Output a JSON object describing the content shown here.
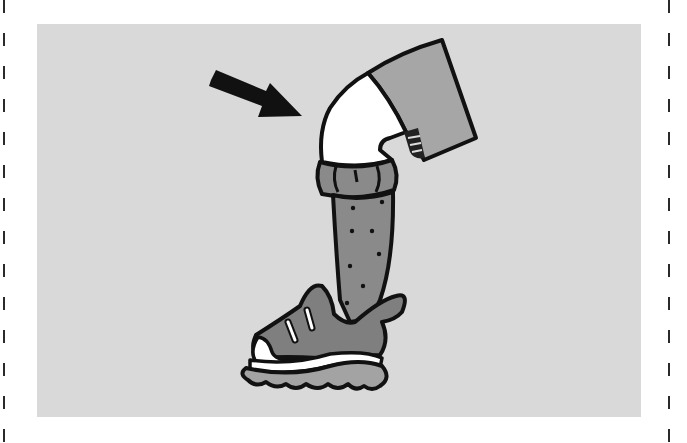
{
  "figure": {
    "arrow_target": "knee",
    "icons": [
      "arrow-icon",
      "leg-illustration",
      "sneaker-icon"
    ]
  },
  "colors": {
    "page_background": "#ffffff",
    "panel_background": "#d9d9d9",
    "outline": "#111111",
    "shorts": "#a6a6a6",
    "sock": "#8a8a8a",
    "shoe": "#7f7f7f",
    "sole": "#a3a3a3",
    "highlight": "#ffffff",
    "cut_line": "#2a2a2a"
  }
}
